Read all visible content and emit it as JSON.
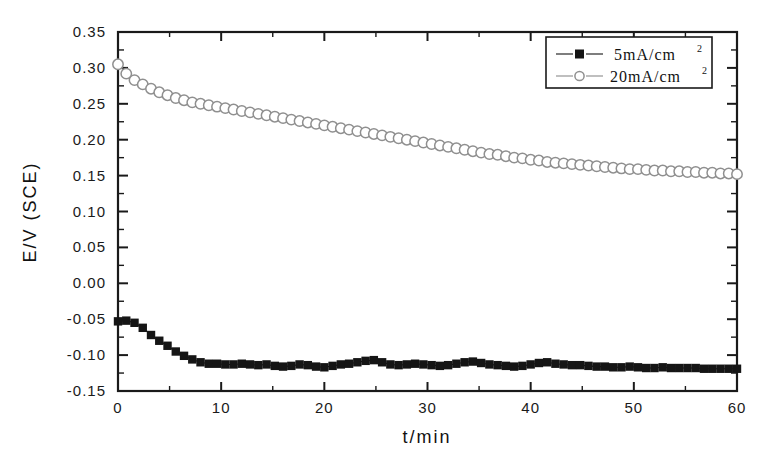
{
  "chart_data": {
    "type": "line",
    "title": "",
    "subtitle": "",
    "xlabel": "t/min",
    "ylabel": "E/V (SCE)",
    "xlim": [
      0,
      60
    ],
    "ylim": [
      -0.15,
      0.35
    ],
    "x_ticks": [
      "0",
      "10",
      "20",
      "30",
      "40",
      "50",
      "60"
    ],
    "x_tick_values": [
      0,
      10,
      20,
      30,
      40,
      50,
      60
    ],
    "x_minor_per_interval": 1,
    "y_ticks": [
      "-0.15",
      "-0.10",
      "-0.05",
      "0.00",
      "0.05",
      "0.10",
      "0.15",
      "0.20",
      "0.25",
      "0.30",
      "0.35"
    ],
    "y_tick_values": [
      -0.15,
      -0.1,
      -0.05,
      0.0,
      0.05,
      0.1,
      0.15,
      0.2,
      0.25,
      0.3,
      0.35
    ],
    "y_minor_per_interval": 1,
    "grid": false,
    "legend_position": "top-right",
    "frame": true,
    "colors": {
      "marker_dark": "#151515",
      "marker_light_stroke": "#8f8f8f",
      "line_dark": "#151515",
      "line_light": "#8a8a8a",
      "axis": "#1a1a1a",
      "background": "#ffffff"
    },
    "series": [
      {
        "name": "5 mA/cm2",
        "label_main": "5mA/cm",
        "label_sup": "2",
        "marker": "filled-square",
        "x": [
          0.0,
          0.8,
          1.6,
          2.4,
          3.2,
          4.0,
          4.8,
          5.6,
          6.4,
          7.2,
          8.0,
          8.8,
          9.6,
          10.4,
          11.2,
          12.0,
          12.8,
          13.6,
          14.4,
          15.2,
          16.0,
          16.8,
          17.6,
          18.4,
          19.2,
          20.0,
          20.8,
          21.6,
          22.4,
          23.2,
          24.0,
          24.8,
          25.6,
          26.4,
          27.2,
          28.0,
          28.8,
          29.6,
          30.4,
          31.2,
          32.0,
          32.8,
          33.6,
          34.4,
          35.2,
          36.0,
          36.8,
          37.6,
          38.4,
          39.2,
          40.0,
          40.8,
          41.6,
          42.4,
          43.2,
          44.0,
          44.8,
          45.6,
          46.4,
          47.2,
          48.0,
          48.8,
          49.6,
          50.4,
          51.2,
          52.0,
          52.8,
          53.6,
          54.4,
          55.2,
          56.0,
          56.8,
          57.6,
          58.4,
          59.2,
          60.0
        ],
        "y": [
          -0.053,
          -0.052,
          -0.055,
          -0.062,
          -0.072,
          -0.08,
          -0.087,
          -0.095,
          -0.101,
          -0.106,
          -0.11,
          -0.112,
          -0.112,
          -0.113,
          -0.113,
          -0.112,
          -0.113,
          -0.114,
          -0.113,
          -0.115,
          -0.116,
          -0.115,
          -0.113,
          -0.114,
          -0.116,
          -0.117,
          -0.115,
          -0.113,
          -0.112,
          -0.11,
          -0.108,
          -0.107,
          -0.11,
          -0.113,
          -0.114,
          -0.113,
          -0.112,
          -0.113,
          -0.114,
          -0.115,
          -0.114,
          -0.112,
          -0.11,
          -0.109,
          -0.111,
          -0.113,
          -0.114,
          -0.115,
          -0.116,
          -0.115,
          -0.113,
          -0.111,
          -0.11,
          -0.112,
          -0.113,
          -0.114,
          -0.114,
          -0.115,
          -0.116,
          -0.116,
          -0.117,
          -0.117,
          -0.116,
          -0.117,
          -0.118,
          -0.118,
          -0.117,
          -0.118,
          -0.118,
          -0.118,
          -0.118,
          -0.119,
          -0.119,
          -0.119,
          -0.119,
          -0.119
        ]
      },
      {
        "name": "20 mA/cm2",
        "label_main": "20mA/cm",
        "label_sup": "2",
        "marker": "open-circle",
        "x": [
          0.0,
          0.8,
          1.6,
          2.4,
          3.2,
          4.0,
          4.8,
          5.6,
          6.4,
          7.2,
          8.0,
          8.8,
          9.6,
          10.4,
          11.2,
          12.0,
          12.8,
          13.6,
          14.4,
          15.2,
          16.0,
          16.8,
          17.6,
          18.4,
          19.2,
          20.0,
          20.8,
          21.6,
          22.4,
          23.2,
          24.0,
          24.8,
          25.6,
          26.4,
          27.2,
          28.0,
          28.8,
          29.6,
          30.4,
          31.2,
          32.0,
          32.8,
          33.6,
          34.4,
          35.2,
          36.0,
          36.8,
          37.6,
          38.4,
          39.2,
          40.0,
          40.8,
          41.6,
          42.4,
          43.2,
          44.0,
          44.8,
          45.6,
          46.4,
          47.2,
          48.0,
          48.8,
          49.6,
          50.4,
          51.2,
          52.0,
          52.8,
          53.6,
          54.4,
          55.2,
          56.0,
          56.8,
          57.6,
          58.4,
          59.2,
          60.0
        ],
        "y": [
          0.305,
          0.292,
          0.283,
          0.277,
          0.271,
          0.266,
          0.262,
          0.258,
          0.255,
          0.252,
          0.25,
          0.248,
          0.246,
          0.244,
          0.242,
          0.24,
          0.238,
          0.236,
          0.234,
          0.232,
          0.23,
          0.228,
          0.226,
          0.224,
          0.222,
          0.22,
          0.218,
          0.216,
          0.214,
          0.212,
          0.21,
          0.208,
          0.206,
          0.204,
          0.202,
          0.2,
          0.198,
          0.196,
          0.194,
          0.192,
          0.19,
          0.188,
          0.186,
          0.184,
          0.182,
          0.18,
          0.179,
          0.177,
          0.175,
          0.174,
          0.172,
          0.171,
          0.169,
          0.168,
          0.167,
          0.166,
          0.165,
          0.164,
          0.163,
          0.162,
          0.161,
          0.16,
          0.159,
          0.159,
          0.158,
          0.157,
          0.157,
          0.156,
          0.156,
          0.155,
          0.155,
          0.154,
          0.154,
          0.153,
          0.153,
          0.152
        ]
      }
    ]
  },
  "legend": {
    "entries": [
      {
        "label_main": "5mA/cm",
        "label_sup": "2",
        "marker": "filled-square"
      },
      {
        "label_main": "20mA/cm",
        "label_sup": "2",
        "marker": "open-circle"
      }
    ]
  }
}
